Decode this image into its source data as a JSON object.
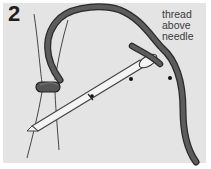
{
  "figure": {
    "step_number": "2",
    "callout_text": "thread\nabove\nneedle",
    "elements": {
      "thread_loop": "dark-thread-loop",
      "base_threads": "light-vertical-threads",
      "knot": "thread-knot",
      "needle": "needle",
      "needle_eye": "needle-eye",
      "marker_dots": 2
    },
    "colors": {
      "background": "#e4e4e4",
      "thread_dark": "#555555",
      "thread_outline": "#2a2a2a",
      "needle_fill": "#f4f4f4",
      "needle_outline": "#444444",
      "text": "#3a3a3a"
    }
  }
}
